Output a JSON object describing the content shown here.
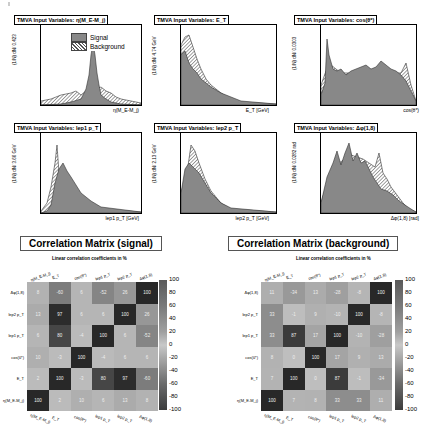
{
  "panels": [
    {
      "title": "TMVA Input Variables: η(M_E-M_j)",
      "ylabel": "(1/N) dN/ 0.423",
      "ylabel_right": "U/O-flow (S,B): (0.0, 0.0)% / (0.0, 0.0)%",
      "xlabel": "η(M_E-M_j)",
      "xticks": [
        "-15",
        "-10",
        "-5",
        "0",
        "5"
      ],
      "yticks": [
        "0",
        "0.05",
        "0.1",
        "0.15",
        "0.2",
        "0.25",
        "0.3",
        "0.35",
        "0.4"
      ]
    },
    {
      "title": "TMVA Input Variables: E_T",
      "ylabel": "(1/N) dN/ 4.74 GeV",
      "ylabel_right": "U/O-flow (S,B): (0.0, 0.0)% / (0.0, 0.0)%",
      "xlabel": "E_T [GeV]",
      "xticks": [
        "50",
        "100",
        "150",
        "200",
        "250",
        "300"
      ],
      "yticks": [
        "0",
        "0.005",
        "0.01",
        "0.015",
        "0.02",
        "0.025"
      ]
    },
    {
      "title": "TMVA Input Variables: cos(θ*)",
      "ylabel": "(1/N) dN/ 0.0303",
      "ylabel_right": "U/O-flow (S,B): (0.0, 0.0)% / (0.0, 0.0)%",
      "xlabel": "cos(θ*)",
      "xticks": [
        "-0.8",
        "-0.6",
        "-0.4",
        "-0.2",
        "0",
        "0.2",
        "0.4",
        "0.6",
        "0.8"
      ],
      "yticks": [
        "0",
        "0.2",
        "0.4",
        "0.6",
        "0.8",
        "1",
        "1.2"
      ]
    },
    {
      "title": "TMVA Input Variables: lep1 p_T",
      "ylabel": "(1/N) dN/ 3.66 GeV",
      "ylabel_right": "U/O-flow (S,B): (0.0, 0.0)% / (0.0, 0.0)%",
      "xlabel": "lep1 p_T [GeV]",
      "xticks": [
        "20",
        "40",
        "60",
        "80",
        "100",
        "120",
        "140",
        "160",
        "180",
        "200",
        "220",
        "240"
      ],
      "yticks": [
        "0",
        "0.005",
        "0.01",
        "0.015",
        "0.02",
        "0.025",
        "0.03"
      ]
    },
    {
      "title": "TMVA Input Variables: lep2 p_T",
      "ylabel": "(1/N) dN/ 2.13 GeV",
      "ylabel_right": "U/O-flow (S,B): (0.0, 0.0)% / (0.0, 0.0)%",
      "xlabel": "lep2 p_T [GeV]",
      "xticks": [
        "20",
        "40",
        "60",
        "80",
        "100",
        "120",
        "140"
      ],
      "yticks": [
        "0",
        "0.01",
        "0.02",
        "0.03",
        "0.04",
        "0.05"
      ]
    },
    {
      "title": "TMVA Input Variables: Δφ(1,8)",
      "ylabel": "(1/N) dN/ 0.0282 rad",
      "ylabel_right": "U/O-flow (S,B): (0.0, 0.0)% / (0.0, 0.0)%",
      "xlabel": "Δφ(1,8) [rad]",
      "xticks": [
        "0.2",
        "0.4",
        "0.6",
        "0.8",
        "1",
        "1.2"
      ],
      "yticks": [
        "0",
        "0.2",
        "0.4",
        "0.6",
        "0.8",
        "1",
        "1.2",
        "1.4",
        "1.6",
        "1.8",
        "2",
        "2.2"
      ]
    }
  ],
  "legend": {
    "signal": "Signal",
    "background": "Background"
  },
  "matrices": [
    {
      "title": "Correlation Matrix (signal)",
      "subtitle": "Linear correlation coefficients in %",
      "rows": [
        "Δφ(1,8)",
        "lep2 p_T",
        "lep1 p_T",
        "cos(θ*)",
        "E_T",
        "η(M_E-M_j)"
      ],
      "cols": [
        "η(M_E-M_j)",
        "E_T",
        "cos(θ*)",
        "lep1 p_T",
        "lep2 p_T",
        "Δφ(1,8)"
      ],
      "values": [
        [
          8,
          -60,
          6,
          -52,
          26,
          100
        ],
        [
          13,
          97,
          6,
          6,
          100,
          26
        ],
        [
          6,
          80,
          -4,
          100,
          6,
          -52
        ],
        [
          10,
          -3,
          100,
          -4,
          6,
          6
        ],
        [
          2,
          100,
          -3,
          80,
          97,
          -60
        ],
        [
          100,
          2,
          10,
          6,
          13,
          8
        ]
      ]
    },
    {
      "title": "Correlation Matrix (background)",
      "subtitle": "Linear correlation coefficients in %",
      "rows": [
        "Δφ(1,8)",
        "lep2 p_T",
        "lep1 p_T",
        "cos(θ*)",
        "E_T",
        "η(M_E-M_j)"
      ],
      "cols": [
        "η(M_E-M_j)",
        "E_T",
        "cos(θ*)",
        "lep1 p_T",
        "lep2 p_T",
        "Δφ(1,8)"
      ],
      "values": [
        [
          11,
          -34,
          13,
          -28,
          -8,
          100
        ],
        [
          33,
          -1,
          9,
          -10,
          100,
          -8
        ],
        [
          33,
          87,
          17,
          100,
          -10,
          -28
        ],
        [
          8,
          0,
          100,
          17,
          9,
          13
        ],
        [
          7,
          100,
          0,
          87,
          -1,
          -34
        ],
        [
          100,
          7,
          8,
          33,
          33,
          11
        ]
      ]
    }
  ],
  "colorbar_ticks": [
    "100",
    "80",
    "60",
    "40",
    "20",
    "0",
    "-20",
    "-40",
    "-60",
    "-80",
    "-100"
  ]
}
